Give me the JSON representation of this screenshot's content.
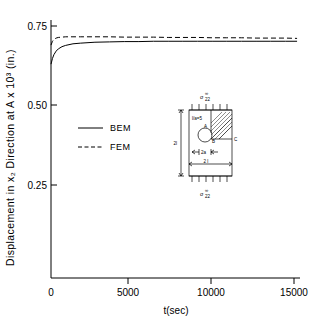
{
  "chart_data": {
    "type": "line",
    "title": "",
    "xlabel": "t(sec)",
    "ylabel": "Displacement in x₂ Direction at A x 10³ (in.)",
    "xlim": [
      0,
      17000
    ],
    "ylim": [
      0,
      0.8
    ],
    "grid": false,
    "legend_position": "center-left",
    "xticks": [
      0,
      5000,
      10000,
      15000
    ],
    "xticklabels": [
      "0",
      "5000",
      "10000",
      "15000"
    ],
    "yticks": [
      0.25,
      0.5,
      0.75
    ],
    "yticklabels": [
      "0.25",
      "0.50",
      "0.75"
    ],
    "series": [
      {
        "name": "BEM",
        "style": "solid",
        "x": [
          0,
          100,
          200,
          350,
          500,
          750,
          1000,
          1500,
          2000,
          3000,
          4000,
          5000,
          6000,
          7000,
          8000,
          9000,
          10000,
          11000,
          12000,
          13000,
          14000,
          15000,
          16000,
          16800
        ],
        "y": [
          0.63,
          0.648,
          0.66,
          0.671,
          0.678,
          0.685,
          0.689,
          0.694,
          0.696,
          0.699,
          0.7,
          0.701,
          0.701,
          0.702,
          0.702,
          0.702,
          0.702,
          0.702,
          0.702,
          0.702,
          0.702,
          0.702,
          0.702,
          0.702
        ]
      },
      {
        "name": "FEM",
        "style": "dashed",
        "x": [
          0,
          100,
          200,
          350,
          500,
          750,
          1000,
          1500,
          2000,
          3000,
          4000,
          5000,
          6000,
          7000,
          8000,
          9000,
          10000,
          11000,
          12000,
          13000,
          14000,
          15000,
          16000,
          16800
        ],
        "y": [
          0.69,
          0.702,
          0.708,
          0.712,
          0.714,
          0.715,
          0.716,
          0.716,
          0.716,
          0.716,
          0.716,
          0.715,
          0.715,
          0.715,
          0.714,
          0.714,
          0.714,
          0.713,
          0.713,
          0.713,
          0.712,
          0.712,
          0.712,
          0.711
        ]
      }
    ]
  },
  "legend": {
    "items": [
      {
        "label": "BEM",
        "style": "solid"
      },
      {
        "label": "FEM",
        "style": "dashed"
      }
    ]
  },
  "inset": {
    "name": "plate-with-circular-hole-schematic",
    "top_stress_label": "σ",
    "top_stress_sub": "22",
    "top_stress_sup": "∞",
    "bottom_stress_label": "σ",
    "bottom_stress_sub": "22",
    "bottom_stress_sup": "∞",
    "ratio_label": "l/a=5",
    "point_a": "A",
    "point_b": "B",
    "point_c": "C",
    "width_label": "2a",
    "span_label": "2 l",
    "height_label": "2l"
  }
}
